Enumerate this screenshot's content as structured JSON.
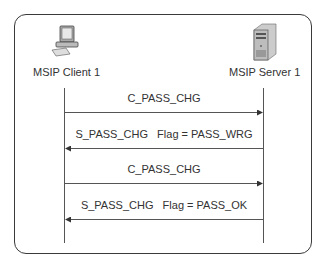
{
  "actors": {
    "client": {
      "label": "MSIP Client 1",
      "icon": "desktop-computer-icon"
    },
    "server": {
      "label": "MSIP Server 1",
      "icon": "server-tower-icon"
    }
  },
  "messages": [
    {
      "text": "C_PASS_CHG",
      "direction": "client-to-server"
    },
    {
      "text": "S_PASS_CHG   Flag = PASS_WRG",
      "direction": "server-to-client"
    },
    {
      "text": "C_PASS_CHG",
      "direction": "client-to-server"
    },
    {
      "text": "S_PASS_CHG   Flag = PASS_OK",
      "direction": "server-to-client"
    }
  ],
  "colors": {
    "line": "#555555",
    "frame": "#3a3a3a",
    "text": "#333333"
  }
}
